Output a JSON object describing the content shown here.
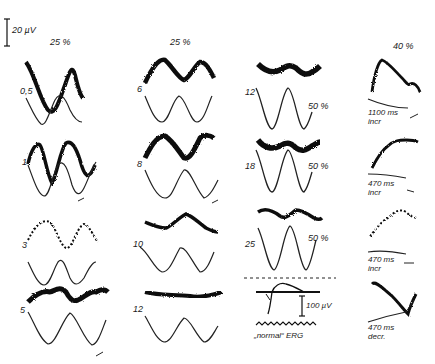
{
  "figure": {
    "scale_bar": {
      "label": "20 µV"
    },
    "column_headers": [
      {
        "label": "25 %"
      },
      {
        "label": "25 %"
      },
      {
        "label": "40 %"
      }
    ],
    "columns": [
      {
        "modulation": "25 %",
        "panels": [
          {
            "frequency_label": "0,5"
          },
          {
            "frequency_label": "1"
          },
          {
            "frequency_label": "3"
          },
          {
            "frequency_label": "5"
          }
        ]
      },
      {
        "modulation": "25 %",
        "panels": [
          {
            "frequency_label": "6"
          },
          {
            "frequency_label": "8"
          },
          {
            "frequency_label": "10"
          },
          {
            "frequency_label": "12"
          }
        ]
      },
      {
        "panels": [
          {
            "frequency_label": "12",
            "modulation_label": "50 %"
          },
          {
            "frequency_label": "18",
            "modulation_label": "50 %"
          },
          {
            "frequency_label": "25",
            "modulation_label": "50 %"
          }
        ],
        "normal_erg": {
          "scale_label": "100 µV",
          "caption": "„normal“ ERG"
        }
      },
      {
        "modulation": "40 %",
        "panels": [
          {
            "duration_label": "1100 ms",
            "direction_label": "incr"
          },
          {
            "duration_label": "470 ms",
            "direction_label": "incr"
          },
          {
            "duration_label": "470 ms",
            "direction_label": "incr"
          },
          {
            "duration_label": "470 ms",
            "direction_label": "decr."
          }
        ]
      }
    ]
  }
}
